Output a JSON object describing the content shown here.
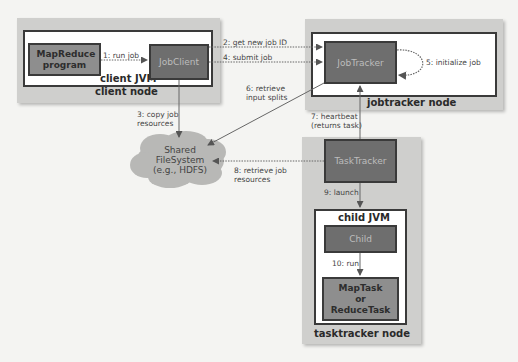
{
  "diagram": {
    "client_node": {
      "caption": "client node",
      "jvm_caption": "client JVM",
      "program_label": "MapReduce program",
      "jobclient_label": "JobClient"
    },
    "jobtracker_node": {
      "caption": "jobtracker node",
      "jobtracker_label": "JobTracker"
    },
    "tasktracker_node": {
      "caption": "tasktracker node",
      "tasktracker_label": "TaskTracker",
      "jvm_caption": "child JVM",
      "child_label": "Child",
      "task_label_line1": "MapTask",
      "task_label_line2": "or",
      "task_label_line3": "ReduceTask"
    },
    "filesystem": {
      "line1": "Shared",
      "line2": "FileSystem",
      "line3": "(e.g., HDFS)"
    },
    "steps": {
      "s1": "1: run job",
      "s2": "2: get new job ID",
      "s3_line1": "3: copy job",
      "s3_line2": "resources",
      "s4": "4: submit job",
      "s5": "5: initialize job",
      "s6_line1": "6: retrieve",
      "s6_line2": "input splits",
      "s7_line1": "7: heartbeat",
      "s7_line2": "(returns task)",
      "s8_line1": "8: retrieve job",
      "s8_line2": "resources",
      "s9": "9: launch",
      "s10": "10: run"
    },
    "colors": {
      "node_bg": "#cfcfcd",
      "dark_box": "#6e6e6e",
      "mid_box": "#8e8e8e",
      "cloud": "#b8b8b6",
      "line": "#666666"
    }
  }
}
